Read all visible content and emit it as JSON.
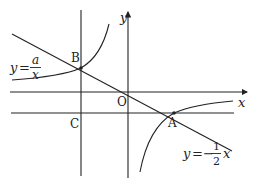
{
  "diagram": {
    "axes": {
      "x_label": "x",
      "y_label": "y",
      "origin_label": "O"
    },
    "points": {
      "A": {
        "label": "A"
      },
      "B": {
        "label": "B"
      },
      "C": {
        "label": "C"
      }
    },
    "curves": {
      "hyperbola": {
        "lhs": "y",
        "eq": "=",
        "numerator": "a",
        "denominator": "x"
      },
      "line": {
        "lhs": "y",
        "eq": "=−",
        "numerator": "1",
        "denominator": "2",
        "var": "x"
      }
    },
    "color": "#222222"
  }
}
